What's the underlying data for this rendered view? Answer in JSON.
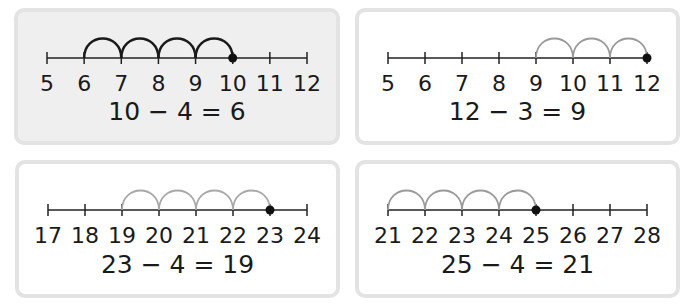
{
  "panels": [
    {
      "id": "top-left",
      "shaded": true,
      "box": {
        "x": 14,
        "y": 8,
        "w": 326,
        "h": 137
      },
      "ticks": [
        5,
        6,
        7,
        8,
        9,
        10,
        11,
        12
      ],
      "start": 10,
      "jumps": 4,
      "end": 6,
      "jump_color": "#1a1a1a",
      "equation": "10 − 4 = 6"
    },
    {
      "id": "top-right",
      "shaded": false,
      "box": {
        "x": 355,
        "y": 8,
        "w": 325,
        "h": 137
      },
      "ticks": [
        5,
        6,
        7,
        8,
        9,
        10,
        11,
        12
      ],
      "start": 12,
      "jumps": 3,
      "end": 9,
      "jump_color": "#9a9a9a",
      "equation": "12 − 3 = 9"
    },
    {
      "id": "bottom-left",
      "shaded": false,
      "box": {
        "x": 15,
        "y": 160,
        "w": 325,
        "h": 138
      },
      "ticks": [
        17,
        18,
        19,
        20,
        21,
        22,
        23,
        24
      ],
      "start": 23,
      "jumps": 4,
      "end": 19,
      "jump_color": "#a8a8a8",
      "equation": "23 − 4 = 19"
    },
    {
      "id": "bottom-right",
      "shaded": false,
      "box": {
        "x": 355,
        "y": 160,
        "w": 325,
        "h": 138
      },
      "ticks": [
        21,
        22,
        23,
        24,
        25,
        26,
        27,
        28
      ],
      "start": 25,
      "jumps": 4,
      "end": 21,
      "jump_color": "#9a9a9a",
      "equation": "25 − 4 = 21"
    }
  ],
  "colors": {
    "line": "#222222",
    "panel_border": "#e3e3e3",
    "panel_shaded": "#efefef"
  }
}
